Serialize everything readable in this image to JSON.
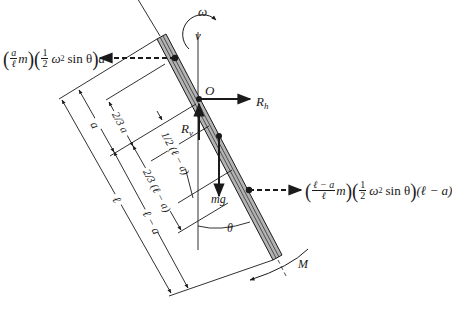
{
  "figure": {
    "type": "free-body diagram",
    "colors": {
      "rod_fill": "#b3b3b3",
      "ink": "#1a1a1a"
    }
  },
  "labels": {
    "omega": "ω",
    "v": "v",
    "origin": "O",
    "Rh": "R",
    "Rh_sub": "h",
    "Rv": "R",
    "Rv_sub": "v",
    "mg": "mg",
    "theta": "θ",
    "M": "M"
  },
  "dimensions": {
    "a": "a",
    "two_thirds_a": "2/3 a",
    "half_l_minus_a": "1/2 (ℓ − a)",
    "two_thirds_l_minus_a": "2/3 (ℓ − a)",
    "l": "ℓ",
    "l_minus_a": "ℓ − a"
  },
  "forces": {
    "upper_inertial": {
      "prefix_num": "a",
      "prefix_den": "ℓ",
      "mass": "m",
      "half_num": "1",
      "half_den": "2",
      "omega_term": "ω",
      "exp": "2",
      "sin_term": "sin θ",
      "arm": "a"
    },
    "lower_inertial": {
      "prefix_num": "ℓ − a",
      "prefix_den": "ℓ",
      "mass": "m",
      "half_num": "1",
      "half_den": "2",
      "omega_term": "ω",
      "exp": "2",
      "sin_term": "sin θ",
      "arm": "(ℓ − a)"
    }
  }
}
